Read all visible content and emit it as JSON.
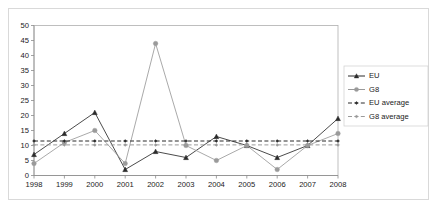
{
  "chart_data": {
    "type": "line",
    "title": "",
    "subtitle": "",
    "xlabel": "",
    "ylabel": "",
    "categories": [
      "1998",
      "1999",
      "2000",
      "2001",
      "2002",
      "2003",
      "2004",
      "2005",
      "2006",
      "2007",
      "2008"
    ],
    "x": [
      1998,
      1999,
      2000,
      2001,
      2002,
      2003,
      2004,
      2005,
      2006,
      2007,
      2008
    ],
    "ylim": [
      0,
      50
    ],
    "yticks": [
      0,
      5,
      10,
      15,
      20,
      25,
      30,
      35,
      40,
      45,
      50
    ],
    "ytick_labels": [
      "0",
      "5",
      "10",
      "15",
      "20",
      "25",
      "30",
      "35",
      "40",
      "45",
      "50"
    ],
    "grid": true,
    "legend_position": "right",
    "series": [
      {
        "name": "EU",
        "values": [
          7,
          14,
          21,
          2,
          8,
          6,
          13,
          10,
          6,
          10,
          19
        ],
        "color": "#2b2b2b",
        "marker": "triangle",
        "dash": false
      },
      {
        "name": "G8",
        "values": [
          4,
          11,
          15,
          4,
          44,
          10,
          5,
          10,
          2,
          10,
          14
        ],
        "color": "#9a9a9a",
        "marker": "circle",
        "dash": false
      },
      {
        "name": "EU average",
        "values": [
          11.5,
          11.5,
          11.5,
          11.5,
          11.5,
          11.5,
          11.5,
          11.5,
          11.5,
          11.5,
          11.5
        ],
        "color": "#2b2b2b",
        "marker": "diamond",
        "dash": true
      },
      {
        "name": "G8 average",
        "values": [
          10.2,
          10.2,
          10.2,
          10.2,
          10.2,
          10.2,
          10.2,
          10.2,
          10.2,
          10.2,
          10.2
        ],
        "color": "#9a9a9a",
        "marker": "diamond",
        "dash": true
      }
    ]
  },
  "legend": {
    "items": [
      {
        "label": "EU"
      },
      {
        "label": "G8"
      },
      {
        "label": "EU average"
      },
      {
        "label": "G8 average"
      }
    ]
  },
  "colors": {
    "eu": "#2b2b2b",
    "g8": "#9a9a9a",
    "grid": "#ebebeb",
    "axis": "#8c8c8c",
    "frame": "#d9d9d9",
    "background": "#ffffff"
  }
}
